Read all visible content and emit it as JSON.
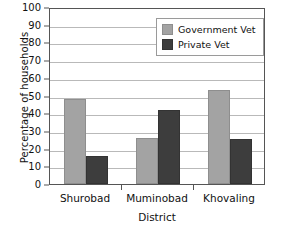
{
  "chart_data": {
    "type": "bar",
    "title": "",
    "xlabel": "District",
    "ylabel": "Percentage of households",
    "categories": [
      "Shurobad",
      "Muminobad",
      "Khovaling"
    ],
    "series": [
      {
        "name": "Government Vet",
        "color": "#a3a3a3",
        "values": [
          48,
          26,
          53
        ]
      },
      {
        "name": "Private Vet",
        "color": "#3d3d3d",
        "values": [
          16,
          42,
          25.5
        ]
      }
    ],
    "ylim": [
      0,
      100
    ],
    "ytick_labels": [
      "0",
      "10",
      "20",
      "30",
      "40",
      "50",
      "60",
      "70",
      "80",
      "90",
      "100"
    ],
    "ytick_values": [
      0,
      10,
      20,
      30,
      40,
      50,
      60,
      70,
      80,
      90,
      100
    ],
    "grid": "horizontal",
    "legend_position": "upper-right-inside",
    "frame": "full-box"
  }
}
